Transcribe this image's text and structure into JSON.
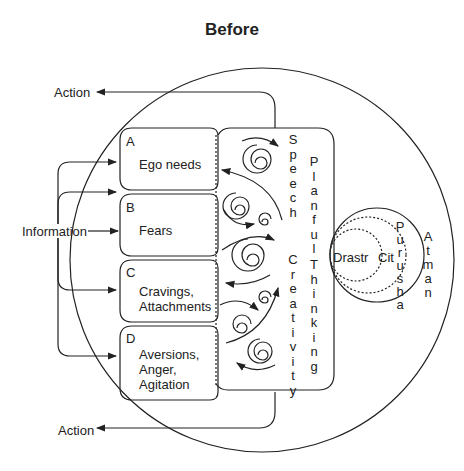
{
  "title": "Before",
  "inputs": {
    "information": "Information"
  },
  "outputs": {
    "action_top": "Action",
    "action_bottom": "Action"
  },
  "boxes": [
    {
      "letter": "A",
      "text": "Ego needs"
    },
    {
      "letter": "B",
      "text": "Fears"
    },
    {
      "letter": "C",
      "text": "Cravings,\nAttachments"
    },
    {
      "letter": "D",
      "text": "Aversions,\nAnger,\nAgitation"
    }
  ],
  "vertical_labels": {
    "speech": "Speech",
    "creativity": "Creativity",
    "planful": "Planful",
    "thinking": "Thinking",
    "purusha": "Purusha",
    "atman": "Atman"
  },
  "inner": {
    "drastr": "Drastr",
    "cit": "Cit"
  },
  "colors": {
    "stroke": "#222222",
    "background": "#ffffff"
  }
}
